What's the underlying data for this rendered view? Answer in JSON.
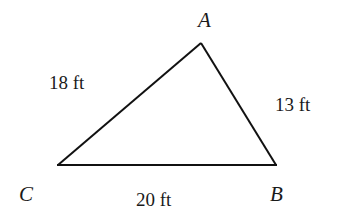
{
  "diagram": {
    "type": "triangle",
    "vertices": {
      "A": {
        "label": "A"
      },
      "B": {
        "label": "B"
      },
      "C": {
        "label": "C"
      }
    },
    "sides": {
      "CA": {
        "label": "18 ft",
        "length": 18,
        "unit": "ft"
      },
      "AB": {
        "label": "13 ft",
        "length": 13,
        "unit": "ft"
      },
      "CB": {
        "label": "20 ft",
        "length": 20,
        "unit": "ft"
      }
    },
    "colors": {
      "stroke": "#111111",
      "text": "#1a1a1a",
      "background": "#ffffff"
    }
  }
}
